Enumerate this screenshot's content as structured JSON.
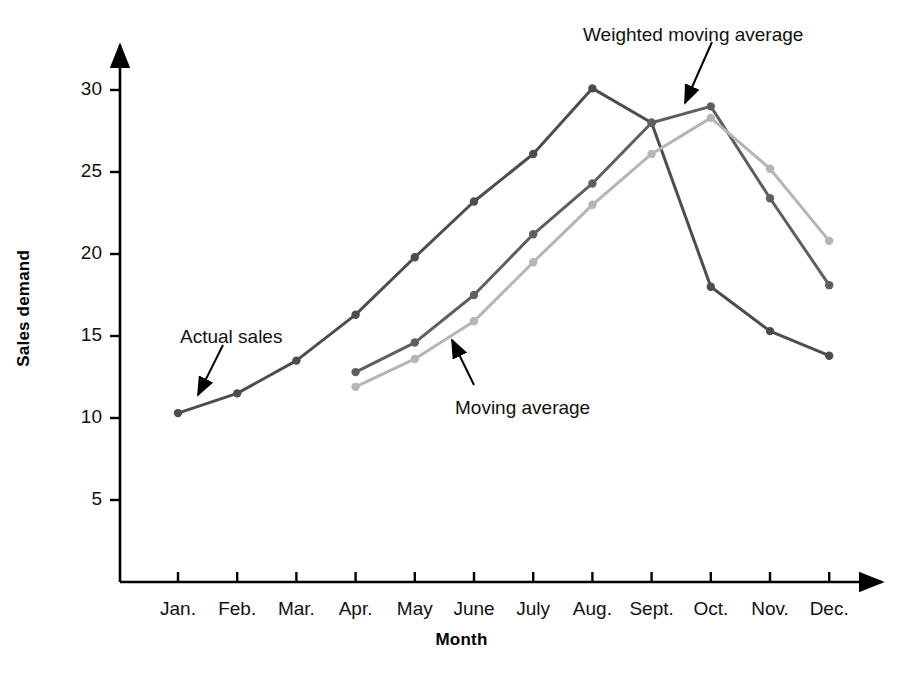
{
  "chart_data": {
    "type": "line",
    "title": "",
    "xlabel": "Month",
    "ylabel": "Sales demand",
    "categories": [
      "Jan.",
      "Feb.",
      "Mar.",
      "Apr.",
      "May",
      "June",
      "July",
      "Aug.",
      "Sept.",
      "Oct.",
      "Nov.",
      "Dec."
    ],
    "yticks": [
      5,
      10,
      15,
      20,
      25,
      30
    ],
    "ylim": [
      0,
      32.5
    ],
    "grid": false,
    "legend": "annotations",
    "series": [
      {
        "name": "Actual sales",
        "color": "#4d4d4d",
        "values": [
          10.3,
          11.5,
          13.5,
          16.3,
          19.8,
          23.2,
          26.1,
          30.1,
          28.0,
          18.0,
          15.3,
          13.8
        ]
      },
      {
        "name": "Weighted moving average",
        "color": "#5f5f5f",
        "values": [
          null,
          null,
          null,
          12.8,
          14.6,
          17.5,
          21.2,
          24.3,
          28.0,
          29.0,
          23.4,
          18.1
        ]
      },
      {
        "name": "Moving average",
        "color": "#b5b5b5",
        "values": [
          null,
          null,
          null,
          11.9,
          13.6,
          15.9,
          19.5,
          23.0,
          26.1,
          28.3,
          25.2,
          20.8
        ]
      }
    ],
    "annotations": [
      {
        "label": "Actual sales",
        "text_x": 180,
        "text_y": 326,
        "arrow_from_x": 223,
        "arrow_from_y": 345,
        "arrow_to_x": 198,
        "arrow_to_y": 395
      },
      {
        "label": "Moving average",
        "text_x": 455,
        "text_y": 397,
        "arrow_from_x": 474,
        "arrow_from_y": 385,
        "arrow_to_x": 452,
        "arrow_to_y": 340
      },
      {
        "label": "Weighted moving average",
        "text_x": 583,
        "text_y": 24,
        "arrow_from_x": 712,
        "arrow_from_y": 42,
        "arrow_to_x": 685,
        "arrow_to_y": 103
      }
    ],
    "axis_color": "#000000"
  }
}
